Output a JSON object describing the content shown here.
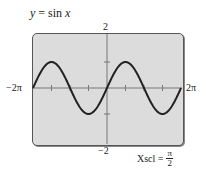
{
  "equation": {
    "lhs": "y",
    "eq": " = sin ",
    "var": "x"
  },
  "window": {
    "ymax_label": "2",
    "ymin_label": "−2",
    "xmin_label": "−2π",
    "xmax_label": "2π"
  },
  "xscl": {
    "label": "Xscl = ",
    "num": "π",
    "den": "2"
  },
  "colors": {
    "screen_bg": "#dcdcdc",
    "curve": "#222222",
    "axis": "#777777"
  },
  "chart_data": {
    "type": "line",
    "title": "y = sin x",
    "function": "sin(x)",
    "xlim": [
      -6.2832,
      6.2832
    ],
    "ylim": [
      -2,
      2
    ],
    "xscl": 1.5708,
    "yscl": 1,
    "x_tick_labels": [
      "-2π",
      "2π"
    ],
    "y_tick_labels": [
      "2",
      "-2"
    ],
    "x": [
      -6.2832,
      -4.7124,
      -3.1416,
      -1.5708,
      0,
      1.5708,
      3.1416,
      4.7124,
      6.2832
    ],
    "series": [
      {
        "name": "sin x",
        "values": [
          0,
          1,
          0,
          -1,
          0,
          1,
          0,
          -1,
          0
        ]
      }
    ],
    "grid": false,
    "xlabel": "",
    "ylabel": ""
  }
}
